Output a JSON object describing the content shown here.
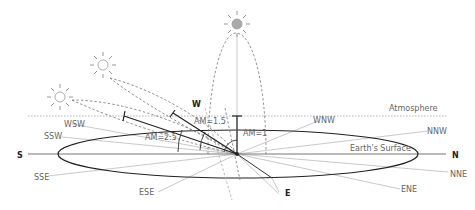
{
  "diagram": {
    "labels": {
      "atmosphere": "Atmosphere",
      "earth_surface": "Earth's Surface",
      "am1": "AM=1",
      "am15": "AM=1.5",
      "am25": "AM=2.5"
    },
    "cardinal": {
      "S": "S",
      "N": "N",
      "W": "W",
      "E": "E"
    },
    "intercardinal": {
      "WSW": "WSW",
      "SSW": "SSW",
      "SSE": "SSE",
      "ESE": "ESE",
      "WNW": "WNW",
      "NNW": "NNW",
      "NNE": "NNE",
      "ENE": "ENE"
    },
    "suns": [
      {
        "name": "sun-zenith",
        "filled": true
      },
      {
        "name": "sun-am15",
        "filled": false
      },
      {
        "name": "sun-am25",
        "filled": false
      }
    ]
  }
}
